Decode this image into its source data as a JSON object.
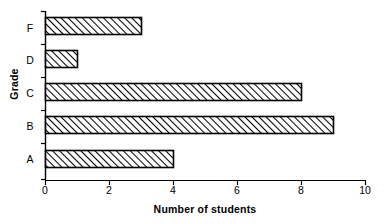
{
  "chart_data": {
    "type": "bar",
    "orientation": "horizontal",
    "title": "",
    "xlabel": "Number of students",
    "ylabel": "Grade",
    "categories": [
      "A",
      "B",
      "C",
      "D",
      "F"
    ],
    "values": [
      4,
      9,
      8,
      1,
      3
    ],
    "category_order_top_to_bottom": [
      "F",
      "D",
      "C",
      "B",
      "A"
    ],
    "xlim": [
      0,
      10
    ],
    "xticks": [
      0,
      2,
      4,
      6,
      8,
      10
    ],
    "xtick_labels": [
      "0",
      "2",
      "4",
      "6",
      "8",
      "10"
    ],
    "grid": false,
    "legend": false,
    "bar_fill": "#ffffff",
    "bar_edge_color": "#000000",
    "bar_hatch": "forward-diagonal",
    "axis_color": "#000000"
  }
}
